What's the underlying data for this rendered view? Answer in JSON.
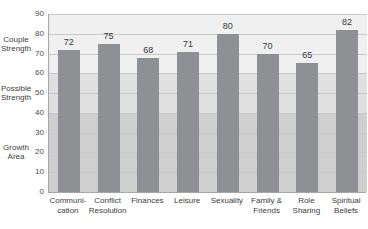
{
  "chart_data": {
    "type": "bar",
    "title": "",
    "subtitle": "",
    "xlabel": "",
    "ylabel": "",
    "ylim": [
      0,
      90
    ],
    "grid": true,
    "legend_position": "none",
    "categories": [
      "Communi-\ncation",
      "Conflict\nResolution",
      "Finances",
      "Leisure",
      "Sexuality",
      "Family &\nFriends",
      "Role\nSharing",
      "Spiritual\nBeliefs"
    ],
    "category_lines": [
      [
        "Communi-",
        "cation"
      ],
      [
        "Conflict",
        "Resolution"
      ],
      [
        "Finances",
        ""
      ],
      [
        "Leisure",
        ""
      ],
      [
        "Sexuality",
        ""
      ],
      [
        "Family &",
        "Friends"
      ],
      [
        "Role",
        "Sharing"
      ],
      [
        "Spiritual",
        "Beliefs"
      ]
    ],
    "values": [
      72,
      75,
      68,
      71,
      80,
      70,
      65,
      82
    ],
    "yticks": [
      0,
      10,
      20,
      30,
      40,
      50,
      60,
      70,
      80,
      90
    ],
    "bands": [
      {
        "label_lines": [
          "Couple",
          "Strength"
        ],
        "min": 60,
        "max": 90,
        "color": "#f0f0f0"
      },
      {
        "label_lines": [
          "Possible",
          "Strength"
        ],
        "min": 40,
        "max": 60,
        "color": "#e0e0e0"
      },
      {
        "label_lines": [
          "Growth",
          "Area"
        ],
        "min": 0,
        "max": 40,
        "color": "#cfcfcf"
      }
    ],
    "bar_color": "#8e9094",
    "gridline_color": "#c9c9c9",
    "axis_color": "#a6a6a6",
    "text_color": "#3d3d3d"
  }
}
